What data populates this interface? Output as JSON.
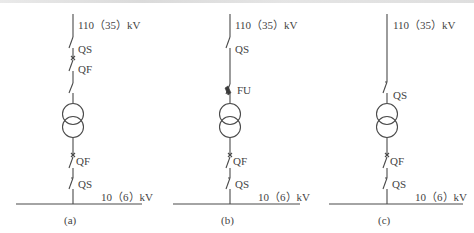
{
  "figure": {
    "diagrams": [
      {
        "id": "a",
        "caption": "(a)",
        "hv_label": "110（35）kV",
        "upper_labels": [
          "QS",
          "QF"
        ],
        "lower_labels": [
          "QF",
          "QS"
        ],
        "lv_label": "10（6）kV"
      },
      {
        "id": "b",
        "caption": "(b)",
        "hv_label": "110（35）kV",
        "upper_labels": [
          "QS",
          "FU"
        ],
        "lower_labels": [
          "QF",
          "QS"
        ],
        "lv_label": "10（6）kV"
      },
      {
        "id": "c",
        "caption": "(c)",
        "hv_label": "110（35）kV",
        "upper_labels": [
          "QS"
        ],
        "lower_labels": [
          "QF",
          "QS"
        ],
        "lv_label": "10（6）kV"
      }
    ],
    "line_color": "#4a4a4a"
  }
}
